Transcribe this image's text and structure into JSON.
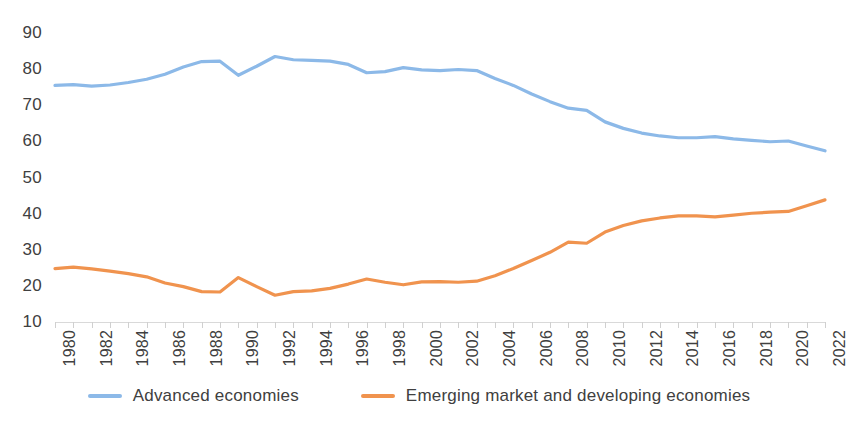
{
  "chart_data": {
    "type": "line",
    "title": "",
    "subtitle": "",
    "xlabel": "",
    "ylabel": "",
    "xlim": [
      1980,
      2022
    ],
    "ylim": [
      10,
      90
    ],
    "ytick_labels": [
      "90",
      "80",
      "70",
      "60",
      "50",
      "40",
      "30",
      "20",
      "10"
    ],
    "ytick_values": [
      90,
      80,
      70,
      60,
      50,
      40,
      30,
      20,
      10
    ],
    "xtick_labels": [
      "1980",
      "1982",
      "1984",
      "1986",
      "1988",
      "1990",
      "1992",
      "1994",
      "1996",
      "1998",
      "2000",
      "2002",
      "2004",
      "2006",
      "2008",
      "2010",
      "2012",
      "2014",
      "2016",
      "2018",
      "2020",
      "2022"
    ],
    "grid": false,
    "legend_position": "bottom",
    "x": [
      1980,
      1981,
      1982,
      1983,
      1984,
      1985,
      1986,
      1987,
      1988,
      1989,
      1990,
      1991,
      1992,
      1993,
      1994,
      1995,
      1996,
      1997,
      1998,
      1999,
      2000,
      2001,
      2002,
      2003,
      2004,
      2005,
      2006,
      2007,
      2008,
      2009,
      2010,
      2011,
      2012,
      2013,
      2014,
      2015,
      2016,
      2017,
      2018,
      2019,
      2020,
      2021,
      2022
    ],
    "series": [
      {
        "name": "Advanced economies",
        "color": "#8CB9E8",
        "values": [
          75.5,
          75.7,
          75.3,
          75.6,
          76.3,
          77.2,
          78.6,
          80.6,
          82.1,
          82.2,
          78.3,
          80.8,
          83.5,
          82.6,
          82.4,
          82.2,
          81.3,
          79.0,
          79.3,
          80.4,
          79.8,
          79.6,
          79.9,
          79.6,
          77.4,
          75.5,
          73.1,
          71.0,
          69.2,
          68.6,
          65.4,
          63.6,
          62.3,
          61.5,
          61.0,
          61.0,
          61.3,
          60.7,
          60.3,
          59.9,
          60.1,
          58.7,
          57.4
        ]
      },
      {
        "name": "Emerging market and developing economies",
        "color": "#F0934E",
        "values": [
          24.8,
          25.2,
          24.7,
          24.1,
          23.4,
          22.5,
          20.8,
          19.8,
          18.4,
          18.3,
          22.3,
          19.8,
          17.4,
          18.4,
          18.6,
          19.3,
          20.5,
          21.9,
          21.0,
          20.3,
          21.1,
          21.2,
          21.0,
          21.3,
          22.8,
          24.8,
          27.0,
          29.3,
          32.1,
          31.8,
          34.9,
          36.7,
          38.0,
          38.8,
          39.4,
          39.4,
          39.1,
          39.6,
          40.1,
          40.4,
          40.6,
          42.2,
          43.8
        ]
      }
    ]
  },
  "legend": {
    "items": [
      {
        "label": "Advanced economies",
        "color": "#8CB9E8"
      },
      {
        "label": "Emerging market and developing economies",
        "color": "#F0934E"
      }
    ]
  }
}
